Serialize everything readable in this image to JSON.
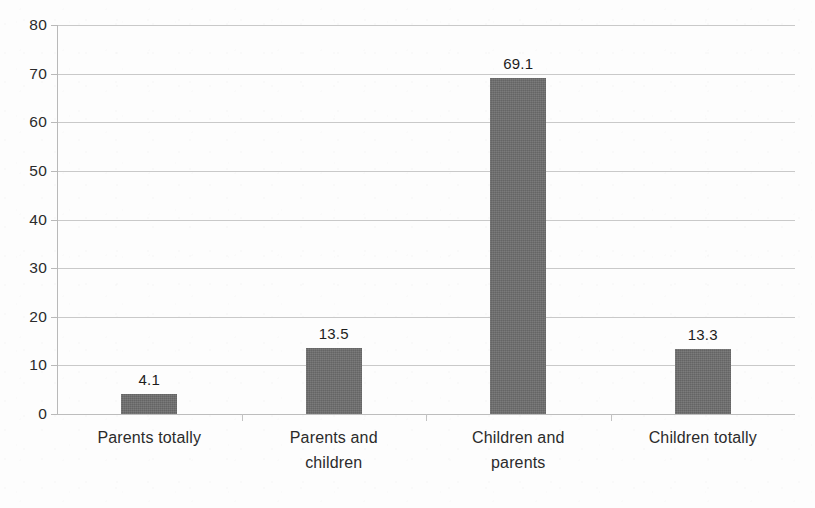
{
  "chart_data": {
    "type": "bar",
    "title": "",
    "subtitle": "",
    "xlabel": "",
    "ylabel": "",
    "ylim": [
      0,
      80
    ],
    "ytick_step": 10,
    "yticks": [
      "80",
      "70",
      "60",
      "50",
      "40",
      "30",
      "20",
      "10",
      "0"
    ],
    "grid": true,
    "legend": false,
    "legend_position": "none",
    "categories": [
      "Parents totally",
      "Parents and children",
      "Children and parents",
      "Children totally"
    ],
    "category_lines": [
      [
        "Parents totally"
      ],
      [
        "Parents and",
        "children"
      ],
      [
        "Children and",
        "parents"
      ],
      [
        "Children totally"
      ]
    ],
    "values": [
      4.1,
      13.5,
      69.1,
      13.3
    ],
    "value_labels": [
      "4.1",
      "13.5",
      "69.1",
      "13.3"
    ],
    "series": [
      {
        "name": "",
        "values": [
          4.1,
          13.5,
          69.1,
          13.3
        ]
      }
    ],
    "colors": {
      "bar_fill": "#6e6e6e",
      "gridline": "#c9c9c9",
      "axis": "#b9b9b9",
      "text": "#231f20",
      "background": "#fdfdfd"
    }
  }
}
